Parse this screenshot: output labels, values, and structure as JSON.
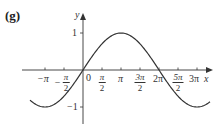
{
  "panel_label": "(g)",
  "chart_data": {
    "type": "line",
    "title": "",
    "function": "y = sin(x/2)",
    "xlabel": "x",
    "ylabel": "y",
    "xlim": [
      -3.77,
      3.45
    ],
    "xlim_units": "pi",
    "ylim": [
      -1.25,
      1.35
    ],
    "grid": false,
    "legend": null,
    "x_ticks": [
      {
        "value": -3.14159,
        "label": "−π"
      },
      {
        "value": -1.5708,
        "label": "−π/2"
      },
      {
        "value": 0,
        "label": "0"
      },
      {
        "value": 1.5708,
        "label": "π/2"
      },
      {
        "value": 3.14159,
        "label": "π"
      },
      {
        "value": 4.71239,
        "label": "3π/2"
      },
      {
        "value": 6.28319,
        "label": "2π"
      },
      {
        "value": 7.85398,
        "label": "5π/2"
      },
      {
        "value": 9.42478,
        "label": "3π"
      }
    ],
    "y_ticks": [
      {
        "value": 1,
        "label": "1"
      },
      {
        "value": -1,
        "label": "−1"
      }
    ],
    "series": [
      {
        "name": "y = sin(x/2)",
        "x": [
          -4.71,
          -3.14159,
          -1.5708,
          0,
          1.5708,
          3.14159,
          4.71239,
          6.28319,
          7.85398,
          9.42478,
          10.6
        ],
        "y": [
          -0.71,
          -1,
          -0.71,
          0,
          0.71,
          1,
          0.71,
          0,
          -0.71,
          -1,
          -0.83
        ]
      }
    ],
    "key_points": {
      "zeros": [
        "0",
        "2π"
      ],
      "maximum": {
        "x": "π",
        "y": 1
      },
      "minima": [
        {
          "x": "−π",
          "y": -1
        },
        {
          "x": "3π",
          "y": -1
        }
      ]
    }
  },
  "labels": {
    "x_axis": "x",
    "y_axis": "y",
    "origin": "0",
    "y_one": "1",
    "y_neg_one": "−1",
    "neg_pi": "−π",
    "neg_pi_half_num": "π",
    "neg_pi_half_den": "2",
    "pi_half_num": "π",
    "pi_half_den": "2",
    "pi": "π",
    "three_pi_half_num": "3π",
    "three_pi_half_den": "2",
    "two_pi": "2π",
    "five_pi_half_num": "5π",
    "five_pi_half_den": "2",
    "three_pi": "3π"
  }
}
